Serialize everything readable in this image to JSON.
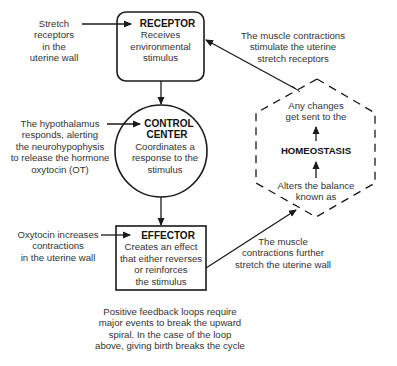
{
  "colors": {
    "line": "#1a1a1a",
    "text": "#333333",
    "background": "#ffffff"
  },
  "nodes": {
    "receptor": {
      "title": "RECEPTOR",
      "lines": [
        "Receives",
        "environmental",
        "stimulus"
      ]
    },
    "control_center": {
      "title_lines": [
        "CONTROL",
        "CENTER"
      ],
      "lines": [
        "Coordinates a",
        "response to the",
        "stimulus"
      ]
    },
    "effector": {
      "title": "EFFECTOR",
      "lines": [
        "Creates an effect",
        "that either reverses",
        "or reinforces",
        "the stimulus"
      ]
    },
    "homeostasis": {
      "top_lines": [
        "Any changes",
        "get sent to the"
      ],
      "title": "HOMEOSTASIS",
      "bottom_lines": [
        "Alters the balance",
        "known as"
      ]
    }
  },
  "annotations": {
    "stretch_receptors": [
      "Stretch",
      "receptors",
      "in the",
      "uterine wall"
    ],
    "hypothalamus": [
      "The hypothalamus",
      "responds, alerting",
      "the neurohypophysis",
      "to release the hormone",
      "oxytocin (OT)"
    ],
    "oxytocin": [
      "Oxytocin increases",
      "contractions",
      "in the uterine wall"
    ],
    "muscle_stimulate": [
      "The muscle contractions",
      "stimulate the uterine",
      "stretch receptors"
    ],
    "muscle_further": [
      "The muscle",
      "contractions further",
      "stretch the uterine wall"
    ],
    "footer": [
      "Positive feedback loops require",
      "major events to break the upward",
      "spiral.  In the case of the loop",
      "above, giving birth breaks the cycle"
    ]
  },
  "arrow_symbol": "↑"
}
